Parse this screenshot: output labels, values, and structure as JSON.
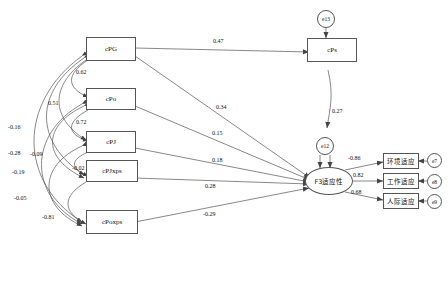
{
  "diagram": {
    "type": "sem-path-diagram",
    "background": "#ffffff",
    "line_color": "#555555",
    "text_color": "#111111"
  },
  "nodes": {
    "exogenous": [
      {
        "id": "cPG",
        "label": "cPG",
        "shape": "rect"
      },
      {
        "id": "cPo",
        "label": "cPo",
        "shape": "rect"
      },
      {
        "id": "cPJ",
        "label": "cPJ",
        "shape": "rect"
      },
      {
        "id": "cPJxps",
        "label": "cPJxps",
        "shape": "rect"
      },
      {
        "id": "cPoxps",
        "label": "cPoxps",
        "shape": "rect"
      }
    ],
    "mediator": {
      "id": "cPs",
      "label": "cPs",
      "shape": "rect"
    },
    "latent": {
      "id": "F3",
      "label": "F3适应性",
      "shape": "ellipse"
    },
    "indicators": [
      {
        "id": "ind1",
        "label": "环境适应",
        "shape": "rect"
      },
      {
        "id": "ind2",
        "label": "工作适应",
        "shape": "rect"
      },
      {
        "id": "ind3",
        "label": "人际适应",
        "shape": "rect"
      }
    ],
    "errors": [
      {
        "id": "e13",
        "label": "e13",
        "shape": "circle"
      },
      {
        "id": "e12",
        "label": "e12",
        "shape": "circle"
      },
      {
        "id": "e7",
        "label": "e7",
        "shape": "circle"
      },
      {
        "id": "e8",
        "label": "e8",
        "shape": "circle"
      },
      {
        "id": "e9",
        "label": "e9",
        "shape": "circle"
      }
    ]
  },
  "paths": {
    "structural": [
      {
        "from": "cPG",
        "to": "cPs",
        "value": "0.47"
      },
      {
        "from": "cPs",
        "to": "F3",
        "value": "0.27"
      },
      {
        "from": "cPG",
        "to": "F3",
        "value": "0.34"
      },
      {
        "from": "cPo",
        "to": "F3",
        "value": "0.15"
      },
      {
        "from": "cPJ",
        "to": "F3",
        "value": "0.18"
      },
      {
        "from": "cPJxps",
        "to": "F3",
        "value": "0.28"
      },
      {
        "from": "cPoxps",
        "to": "F3",
        "value": "-0.29"
      }
    ],
    "loadings": [
      {
        "from": "F3",
        "to": "ind1",
        "value": "-0.86"
      },
      {
        "from": "F3",
        "to": "ind2",
        "value": "0.82"
      },
      {
        "from": "F3",
        "to": "ind3",
        "value": "0.68"
      }
    ],
    "covariances": [
      {
        "from": "cPG",
        "to": "cPo",
        "value": "0.62"
      },
      {
        "from": "cPo",
        "to": "cPJ",
        "value": "0.72"
      },
      {
        "from": "cPG",
        "to": "cPJ",
        "value": "0.51"
      },
      {
        "from": "cPJ",
        "to": "cPJxps",
        "value": "-0.02"
      },
      {
        "from": "cPG",
        "to": "cPJxps",
        "value": "-0.16"
      },
      {
        "from": "cPo",
        "to": "cPJxps",
        "value": "-0.28"
      },
      {
        "from": "cPG",
        "to": "cPoxps",
        "value": "-0.09"
      },
      {
        "from": "cPo",
        "to": "cPoxps",
        "value": "-0.19"
      },
      {
        "from": "cPJ",
        "to": "cPoxps",
        "value": "-0.05"
      },
      {
        "from": "cPJxps",
        "to": "cPoxps",
        "value": "-0.81"
      }
    ]
  }
}
